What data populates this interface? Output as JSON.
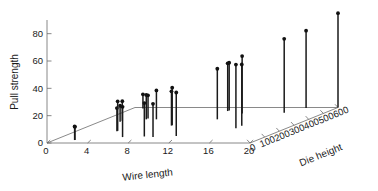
{
  "chart_data": {
    "type": "scatter",
    "title": "",
    "subtitle": "",
    "projection": "3d-stem",
    "grid": false,
    "legend": null,
    "axes": {
      "x": {
        "label": "Wire length",
        "ticks": [
          0,
          4,
          8,
          12,
          16,
          20
        ],
        "tick_labels": [
          "0",
          "4",
          "8",
          "12",
          "16",
          "20"
        ],
        "range": [
          0,
          20
        ]
      },
      "y": {
        "label": "Die height",
        "ticks": [
          0,
          100,
          200,
          300,
          400,
          500,
          600
        ],
        "tick_labels": [
          "0",
          "100",
          "200",
          "300",
          "400",
          "500",
          "600"
        ],
        "range": [
          0,
          600
        ]
      },
      "z": {
        "label": "Pull strength",
        "ticks": [
          0,
          20,
          40,
          60,
          80
        ],
        "tick_labels": [
          "0",
          "20",
          "40",
          "60",
          "80"
        ],
        "range": [
          0,
          90
        ]
      }
    },
    "point_fields": [
      "wire_length",
      "die_height",
      "pull_strength"
    ],
    "points": [
      {
        "wire_length": 2,
        "die_height": 50,
        "pull_strength": 9.95
      },
      {
        "wire_length": 8,
        "die_height": 110,
        "pull_strength": 24.45
      },
      {
        "wire_length": 11,
        "die_height": 120,
        "pull_strength": 31.75
      },
      {
        "wire_length": 10,
        "die_height": 550,
        "pull_strength": 35.0
      },
      {
        "wire_length": 8,
        "die_height": 295,
        "pull_strength": 25.02
      },
      {
        "wire_length": 4,
        "die_height": 200,
        "pull_strength": 16.86
      },
      {
        "wire_length": 2,
        "die_height": 375,
        "pull_strength": 14.38
      },
      {
        "wire_length": 2,
        "die_height": 52,
        "pull_strength": 9.6
      },
      {
        "wire_length": 9,
        "die_height": 100,
        "pull_strength": 24.35
      },
      {
        "wire_length": 8,
        "die_height": 300,
        "pull_strength": 27.5
      },
      {
        "wire_length": 4,
        "die_height": 412,
        "pull_strength": 17.08
      },
      {
        "wire_length": 11,
        "die_height": 400,
        "pull_strength": 37.0
      },
      {
        "wire_length": 12,
        "die_height": 500,
        "pull_strength": 41.95
      },
      {
        "wire_length": 2,
        "die_height": 360,
        "pull_strength": 11.66
      },
      {
        "wire_length": 4,
        "die_height": 205,
        "pull_strength": 21.65
      },
      {
        "wire_length": 4,
        "die_height": 400,
        "pull_strength": 17.89
      },
      {
        "wire_length": 20,
        "die_height": 600,
        "pull_strength": 69.0
      },
      {
        "wire_length": 1,
        "die_height": 585,
        "pull_strength": 10.3
      },
      {
        "wire_length": 10,
        "die_height": 540,
        "pull_strength": 34.93
      },
      {
        "wire_length": 15,
        "die_height": 250,
        "pull_strength": 46.59
      },
      {
        "wire_length": 15,
        "die_height": 290,
        "pull_strength": 44.88
      },
      {
        "wire_length": 16,
        "die_height": 510,
        "pull_strength": 54.12
      },
      {
        "wire_length": 17,
        "die_height": 590,
        "pull_strength": 56.63
      },
      {
        "wire_length": 6,
        "die_height": 100,
        "pull_strength": 22.13
      },
      {
        "wire_length": 5,
        "die_height": 400,
        "pull_strength": 21.15
      }
    ]
  },
  "labels": {
    "x_title": "Wire length",
    "y_title": "Die height",
    "z_title": "Pull strength",
    "x_ticks": [
      "0",
      "4",
      "8",
      "12",
      "16",
      "20"
    ],
    "y_ticks": [
      "0",
      "100",
      "200",
      "300",
      "400",
      "500",
      "600"
    ],
    "z_ticks": [
      "0",
      "20",
      "40",
      "60",
      "80"
    ]
  },
  "colors": {
    "axis": "#6b6b6b",
    "stem": "#1a1a1a",
    "marker": "#111111",
    "background": "#ffffff",
    "text": "#1a1a1a"
  }
}
